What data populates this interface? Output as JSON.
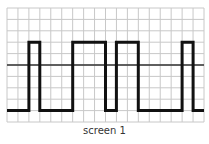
{
  "caption": "screen 1",
  "colors": {
    "grid": "#c8c8c8",
    "midline": "#333333",
    "signal": "#111111",
    "caption": "#333333"
  },
  "grid": {
    "x0": 7,
    "y0": 8,
    "x1": 204,
    "y1": 122,
    "columns": 18,
    "rows": 10
  },
  "chart_data": {
    "type": "line",
    "title": "screen 1",
    "grid": {
      "columns": 18,
      "rows": 10,
      "on": true
    },
    "reference_line_row": 5,
    "levels": {
      "high_row": 3,
      "low_row": 9
    },
    "transitions": [
      {
        "col": 0,
        "level": "low"
      },
      {
        "col": 2,
        "level": "high"
      },
      {
        "col": 3,
        "level": "low"
      },
      {
        "col": 6,
        "level": "high"
      },
      {
        "col": 9,
        "level": "low"
      },
      {
        "col": 10,
        "level": "high"
      },
      {
        "col": 12,
        "level": "low"
      },
      {
        "col": 16,
        "level": "high"
      },
      {
        "col": 17,
        "level": "low"
      },
      {
        "col": 18,
        "level": "end"
      }
    ],
    "x": [
      0,
      2,
      2,
      3,
      3,
      6,
      6,
      9,
      9,
      10,
      10,
      12,
      12,
      16,
      16,
      17,
      17,
      18
    ],
    "values": [
      0,
      0,
      1,
      1,
      0,
      0,
      1,
      1,
      0,
      0,
      1,
      1,
      0,
      0,
      1,
      1,
      0,
      0
    ]
  }
}
